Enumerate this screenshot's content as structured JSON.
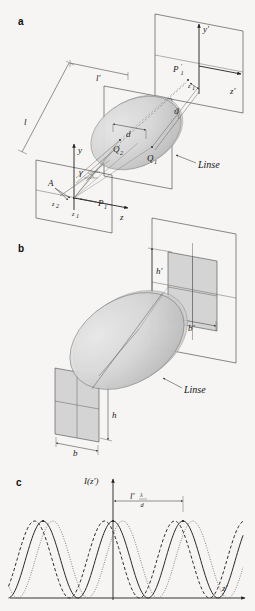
{
  "figure": {
    "background_color": "#f6f5f3",
    "ink_color": "#2a2a2a"
  },
  "panels": [
    {
      "letter": "a",
      "name": "object-lens-image-geometry",
      "labels": {
        "object_plane_axis_y": "y",
        "object_plane_axis_z": "z",
        "image_plane_axis_y": "y'",
        "image_plane_axis_z": "z'",
        "object_point_A": "A",
        "object_coord_z1": "z",
        "object_coord_z1_sub": "1",
        "object_coord_z2": "z",
        "object_coord_z2_sub": "2",
        "object_point_P1": "P",
        "object_point_P1_sub": "1",
        "image_point_P1p": "P",
        "image_point_P1p_sub": "1",
        "image_coord_z1p": "z",
        "image_coord_z1p_sub": "1",
        "lens_point_Q1": "Q",
        "lens_point_Q1_sub": "1",
        "lens_point_Q2": "Q",
        "lens_point_Q2_sub": "2",
        "aperture_spacing_d": "d",
        "object_distance_l": "l",
        "image_distance_lp": "l'",
        "angle_gamma": "γ",
        "angle_theta": "ϑ",
        "lens_caption": "Linse"
      }
    },
    {
      "letter": "b",
      "name": "grating-imaging-geometry",
      "labels": {
        "image_height_hp": "h'",
        "image_width_bp": "b'",
        "object_height_h": "h",
        "object_width_b": "b",
        "lens_caption": "Linse"
      }
    },
    {
      "letter": "c",
      "name": "intensity-profile-plot",
      "labels": {
        "y_axis": "I(z')",
        "x_axis": "z'",
        "fringe_spacing_lead": "l'",
        "fringe_spacing_num": "λ",
        "fringe_spacing_den": "d"
      }
    }
  ],
  "chart_data": {
    "type": "line",
    "title": "",
    "xlabel": "z'",
    "ylabel": "I(z')",
    "grid": false,
    "legend": null,
    "annotations": [
      {
        "text": "l' λ/d",
        "meaning": "fringe period between adjacent intensity maxima",
        "from_x": 0,
        "to_x": 1
      }
    ],
    "x": [
      -2.6,
      -2.4,
      -2.2,
      -2.0,
      -1.8,
      -1.6,
      -1.4,
      -1.2,
      -1.0,
      -0.8,
      -0.6,
      -0.4,
      -0.2,
      0.0,
      0.2,
      0.4,
      0.6,
      0.8,
      1.0,
      1.2,
      1.4,
      1.6,
      1.8,
      2.0,
      2.2,
      2.4,
      2.6
    ],
    "series": [
      {
        "name": "curve-solid",
        "style": "solid",
        "phase": 0.0,
        "period": 1.0,
        "amplitude": 1.0,
        "values": [
          0.1,
          0.35,
          0.72,
          0.97,
          0.9,
          0.58,
          0.2,
          0.02,
          0.1,
          0.4,
          0.78,
          0.98,
          0.86,
          1.0,
          0.86,
          0.52,
          0.16,
          0.01,
          0.14,
          0.46,
          0.82,
          1.0,
          0.84,
          0.5,
          0.15,
          0.02,
          0.12
        ]
      },
      {
        "name": "curve-dashed",
        "style": "dashed",
        "phase": -0.12,
        "period": 1.0,
        "amplitude": 1.0,
        "values": [
          0.28,
          0.62,
          0.92,
          0.99,
          0.74,
          0.38,
          0.07,
          0.02,
          0.26,
          0.62,
          0.92,
          0.99,
          0.76,
          0.92,
          0.64,
          0.3,
          0.05,
          0.03,
          0.3,
          0.66,
          0.94,
          0.98,
          0.7,
          0.34,
          0.06,
          0.03,
          0.3
        ]
      },
      {
        "name": "curve-dotted",
        "style": "dotted",
        "phase": 0.14,
        "period": 1.0,
        "amplitude": 1.0,
        "values": [
          0.02,
          0.14,
          0.45,
          0.8,
          0.99,
          0.88,
          0.52,
          0.16,
          0.01,
          0.14,
          0.46,
          0.82,
          0.98,
          0.88,
          0.98,
          0.8,
          0.44,
          0.12,
          0.01,
          0.18,
          0.52,
          0.86,
          0.99,
          0.78,
          0.4,
          0.1,
          0.01
        ]
      }
    ],
    "ylim": [
      0,
      1.05
    ],
    "xlim": [
      -2.7,
      2.7
    ]
  }
}
